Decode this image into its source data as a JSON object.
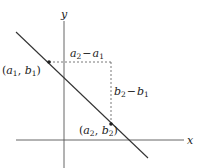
{
  "diagram": {
    "axes": {
      "x_label": "x",
      "y_label": "y"
    },
    "points": [
      {
        "label_a": "a",
        "label_b": "b",
        "sub": "1",
        "x": 49,
        "y": 62
      },
      {
        "label_a": "a",
        "label_b": "b",
        "sub": "2",
        "x": 111,
        "y": 124
      }
    ],
    "run_label": {
      "a2": "a",
      "sub2": "2",
      "minus": "−",
      "a1": "a",
      "sub1": "1"
    },
    "rise_label": {
      "b2": "b",
      "sub2": "2",
      "minus": "−",
      "b1": "b",
      "sub1": "1"
    },
    "colors": {
      "line": "#333333",
      "dashed": "#555555",
      "text": "#222222"
    }
  }
}
